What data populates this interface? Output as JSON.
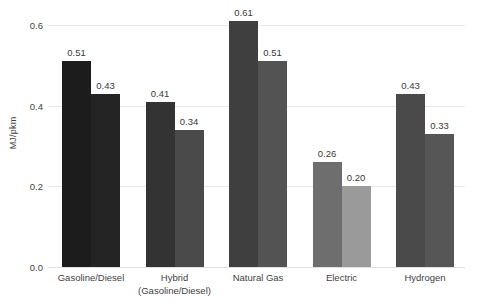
{
  "chart_data": {
    "type": "bar",
    "title": "",
    "subtitle": "",
    "xlabel": "",
    "ylabel": "MJ/pkm",
    "ylim": [
      0,
      0.6
    ],
    "grid": true,
    "legend": "none",
    "y_ticks": [
      "0.0",
      "0.2",
      "0.4",
      "0.6"
    ],
    "y_tick_values": [
      0.0,
      0.2,
      0.4,
      0.6
    ],
    "categories": [
      "Gasoline/Diesel",
      "Hybrid (Gasoline/Diesel)",
      "Natural Gas",
      "Electric",
      "Hydrogen"
    ],
    "category_lines": [
      [
        "Gasoline/Diesel"
      ],
      [
        "Hybrid",
        "(Gasoline/Diesel)"
      ],
      [
        "Natural Gas"
      ],
      [
        "Electric"
      ],
      [
        "Hydrogen"
      ]
    ],
    "series": [
      {
        "name": "Series 1",
        "values": [
          0.51,
          0.41,
          0.61,
          0.26,
          0.43
        ],
        "labels": [
          "0.51",
          "0.41",
          "0.61",
          "0.26",
          "0.43"
        ],
        "colors": [
          "#1c1c1c",
          "#333333",
          "#3f3f3f",
          "#6e6e6e",
          "#4a4a4a"
        ]
      },
      {
        "name": "Series 2",
        "values": [
          0.43,
          0.34,
          0.51,
          0.2,
          0.33
        ],
        "labels": [
          "0.43",
          "0.34",
          "0.51",
          "0.20",
          "0.33"
        ],
        "colors": [
          "#242424",
          "#4a4a4a",
          "#535353",
          "#9a9a9a",
          "#565656"
        ]
      }
    ],
    "colors": {
      "gridline": "#e8e8e8",
      "background": "#ffffff",
      "text": "#3f3f3f"
    }
  }
}
